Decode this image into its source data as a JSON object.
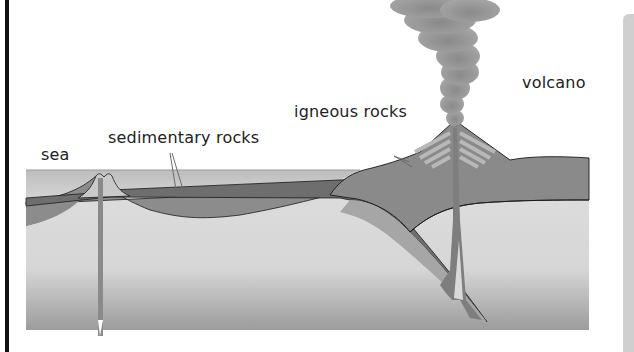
{
  "diagram": {
    "labels": {
      "sea": "sea",
      "sedimentary": "sedimentary rocks",
      "igneous": "igneous rocks",
      "volcano": "volcano"
    },
    "colors": {
      "mantle_light": "#d9d9d9",
      "mantle_dark": "#9a9a9a",
      "sea": "#cfcfcf",
      "sediment_dark": "#6e6e6e",
      "sediment_mid": "#8c8c8c",
      "plate_light": "#a8a8a8",
      "volcano_body": "#8a8a8a",
      "igneous_stripe": "#b5b5b5",
      "ash": "#8f8f8f",
      "outline": "#1a1a1a"
    }
  }
}
